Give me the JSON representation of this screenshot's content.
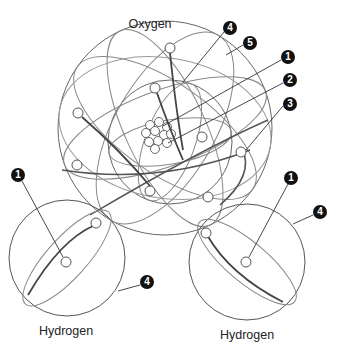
{
  "diagram": {
    "title_labels": {
      "oxygen": "Oxygen",
      "hydrogen_left": "Hydrogen",
      "hydrogen_right": "Hydrogen"
    },
    "callouts": [
      {
        "id": "o-4",
        "number": "4",
        "x": 230,
        "y": 28,
        "target": "oxygen-orbital-line"
      },
      {
        "id": "o-5",
        "number": "5",
        "x": 250,
        "y": 43,
        "target": "oxygen-outer-shell"
      },
      {
        "id": "o-1",
        "number": "1",
        "x": 288,
        "y": 57,
        "target": "nucleus"
      },
      {
        "id": "o-2",
        "number": "2",
        "x": 290,
        "y": 80,
        "target": "nucleus"
      },
      {
        "id": "o-3",
        "number": "3",
        "x": 290,
        "y": 104,
        "target": "electron"
      },
      {
        "id": "hl-1",
        "number": "1",
        "x": 18,
        "y": 175,
        "target": "hydrogen-left-nucleus"
      },
      {
        "id": "hl-4",
        "number": "4",
        "x": 147,
        "y": 282,
        "target": "hydrogen-left-shell"
      },
      {
        "id": "hr-1",
        "number": "1",
        "x": 291,
        "y": 178,
        "target": "hydrogen-right-nucleus"
      },
      {
        "id": "hr-4",
        "number": "4",
        "x": 320,
        "y": 212,
        "target": "hydrogen-right-shell"
      }
    ],
    "colors": {
      "line": "#555555",
      "orbit": "#777777",
      "bond": "#444444",
      "badge": "#111111"
    }
  }
}
